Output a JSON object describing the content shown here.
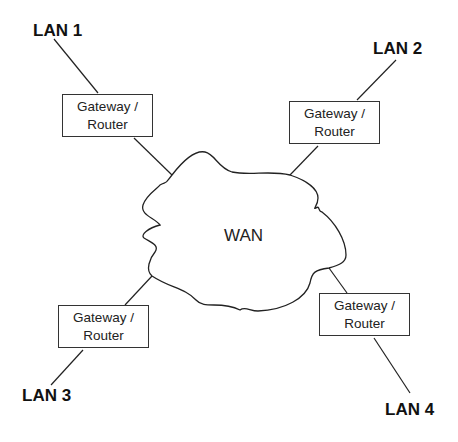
{
  "diagram": {
    "type": "network-topology",
    "center": {
      "label": "WAN",
      "shape": "cloud"
    },
    "nodes": [
      {
        "id": "lan1",
        "label": "LAN 1"
      },
      {
        "id": "lan2",
        "label": "LAN 2"
      },
      {
        "id": "lan3",
        "label": "LAN 3"
      },
      {
        "id": "lan4",
        "label": "LAN 4"
      }
    ],
    "gateways": [
      {
        "id": "gw1",
        "line1": "Gateway /",
        "line2": "Router"
      },
      {
        "id": "gw2",
        "line1": "Gateway /",
        "line2": "Router"
      },
      {
        "id": "gw3",
        "line1": "Gateway /",
        "line2": "Router"
      },
      {
        "id": "gw4",
        "line1": "Gateway /",
        "line2": "Router"
      }
    ],
    "edges": [
      [
        "LAN 1",
        "Gateway / Router 1"
      ],
      [
        "Gateway / Router 1",
        "WAN"
      ],
      [
        "LAN 2",
        "Gateway / Router 2"
      ],
      [
        "Gateway / Router 2",
        "WAN"
      ],
      [
        "LAN 3",
        "Gateway / Router 3"
      ],
      [
        "Gateway / Router 3",
        "WAN"
      ],
      [
        "LAN 4",
        "Gateway / Router 4"
      ],
      [
        "Gateway / Router 4",
        "WAN"
      ]
    ],
    "colors": {
      "stroke": "#222222",
      "background": "#ffffff"
    }
  }
}
